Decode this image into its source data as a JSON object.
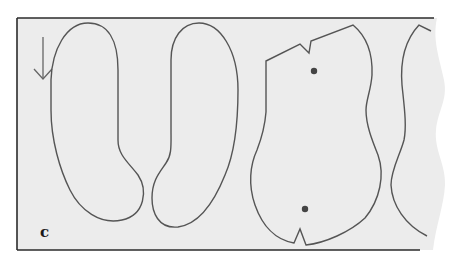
{
  "figure": {
    "panel_label": "c",
    "colors": {
      "paper": "#ececec",
      "outline": "#555555",
      "frame": "#2b2b2b",
      "dot": "#444444",
      "background": "#ffffff"
    },
    "pieces": [
      {
        "name": "rounded-piece-left",
        "shape": "elongated bean"
      },
      {
        "name": "rounded-piece-middle",
        "shape": "elongated bean"
      },
      {
        "name": "notched-body-piece",
        "shape": "body panel with notches",
        "markers": 2
      },
      {
        "name": "partial-piece-right",
        "shape": "curved panel edge (cut off)"
      }
    ],
    "arrow": {
      "direction": "down"
    }
  }
}
